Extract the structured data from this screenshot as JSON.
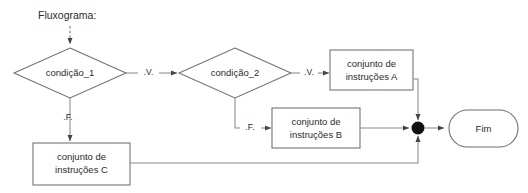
{
  "diagram": {
    "caption": "Fluxograma:",
    "nodes": {
      "decision_1": "condição_1",
      "decision_2": "condição_2",
      "process_a_line1": "conjunto de",
      "process_a_line2": "instruções A",
      "process_b_line1": "conjunto de",
      "process_b_line2": "instruções B",
      "process_c_line1": "conjunto de",
      "process_c_line2": "instruções C",
      "terminator_end": "Fim"
    },
    "edge_labels": {
      "d1_true": ".V.",
      "d1_false": ".F.",
      "d2_true": ".V.",
      "d2_false": ".F."
    },
    "colors": {
      "stroke": "#6f6f6f",
      "connector": "#8a8a8a",
      "text": "#2b2b2b",
      "junction": "#111111",
      "background": "#ffffff"
    }
  }
}
